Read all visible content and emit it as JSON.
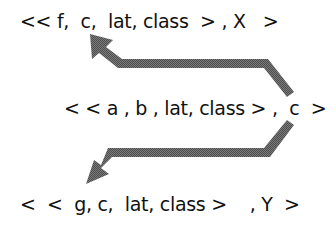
{
  "diagram": {
    "rows": {
      "top": "<< f,  c,  lat, class  > , X   >",
      "middle": "< < a , b , lat, class > ,  c  >",
      "bottom": "<  <  g, c,  lat, class >    , Y  >"
    },
    "arrows": [
      {
        "name": "arrow-c-to-top",
        "from": "middle.c",
        "to": "top.c",
        "direction": "up-left"
      },
      {
        "name": "arrow-c-to-bottom",
        "from": "middle.c",
        "to": "bottom.g",
        "direction": "down-left"
      }
    ],
    "colors": {
      "text": "#111111",
      "arrow_fill": "#6b6b6b",
      "background": "#ffffff"
    }
  }
}
